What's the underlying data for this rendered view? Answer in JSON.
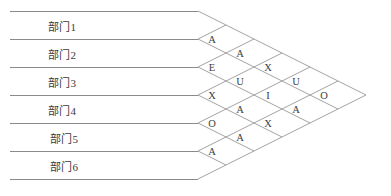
{
  "diagram": {
    "type": "slp-relationship-chart",
    "title": "",
    "line_color": "#8a8a8a",
    "text_color": "#3d3d3d",
    "background_color": "#ffffff",
    "band_height": 28,
    "band_top": 11,
    "lattice_origin_x": 198,
    "departments": [
      {
        "id": 1,
        "label": "部门1"
      },
      {
        "id": 2,
        "label": "部门2"
      },
      {
        "id": 3,
        "label": "部门3"
      },
      {
        "id": 4,
        "label": "部门4"
      },
      {
        "id": 5,
        "label": "部门5"
      },
      {
        "id": 6,
        "label": "部门6"
      }
    ],
    "relationship_columns": [
      {
        "column": 1,
        "pairs": [
          "1-2",
          "2-3",
          "3-4",
          "4-5",
          "5-6"
        ],
        "values": [
          "A",
          "E",
          "X",
          "O",
          "A"
        ]
      },
      {
        "column": 2,
        "pairs": [
          "1-3",
          "2-4",
          "3-5",
          "4-6"
        ],
        "values": [
          "A",
          "U",
          "A",
          "A"
        ]
      },
      {
        "column": 3,
        "pairs": [
          "1-4",
          "2-5",
          "3-6"
        ],
        "values": [
          "X",
          "I",
          "X"
        ]
      },
      {
        "column": 4,
        "pairs": [
          "1-5",
          "2-6"
        ],
        "values": [
          "U",
          "A"
        ]
      },
      {
        "column": 5,
        "pairs": [
          "1-6"
        ],
        "values": [
          "O"
        ]
      }
    ],
    "cells": [
      {
        "pair": "1-2",
        "value": "A",
        "col": 1,
        "row": 0
      },
      {
        "pair": "2-3",
        "value": "E",
        "col": 1,
        "row": 1
      },
      {
        "pair": "3-4",
        "value": "X",
        "col": 1,
        "row": 2
      },
      {
        "pair": "4-5",
        "value": "O",
        "col": 1,
        "row": 3
      },
      {
        "pair": "5-6",
        "value": "A",
        "col": 1,
        "row": 4
      },
      {
        "pair": "1-3",
        "value": "A",
        "col": 2,
        "row": 0
      },
      {
        "pair": "2-4",
        "value": "U",
        "col": 2,
        "row": 1
      },
      {
        "pair": "3-5",
        "value": "A",
        "col": 2,
        "row": 2
      },
      {
        "pair": "4-6",
        "value": "A",
        "col": 2,
        "row": 3
      },
      {
        "pair": "1-4",
        "value": "X",
        "col": 3,
        "row": 0
      },
      {
        "pair": "2-5",
        "value": "I",
        "col": 3,
        "row": 1
      },
      {
        "pair": "3-6",
        "value": "X",
        "col": 3,
        "row": 2
      },
      {
        "pair": "1-5",
        "value": "U",
        "col": 4,
        "row": 0
      },
      {
        "pair": "2-6",
        "value": "A",
        "col": 4,
        "row": 1
      },
      {
        "pair": "1-6",
        "value": "O",
        "col": 5,
        "row": 0
      }
    ]
  }
}
